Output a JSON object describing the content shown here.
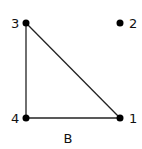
{
  "diagram": {
    "type": "graph",
    "caption": "B",
    "nodes": [
      {
        "id": "1",
        "label": "1",
        "x": 120,
        "y": 118,
        "label_dx": 9,
        "label_dy": 5
      },
      {
        "id": "2",
        "label": "2",
        "x": 120,
        "y": 23,
        "label_dx": 9,
        "label_dy": 5
      },
      {
        "id": "3",
        "label": "3",
        "x": 26,
        "y": 23,
        "label_dx": -15,
        "label_dy": 5
      },
      {
        "id": "4",
        "label": "4",
        "x": 26,
        "y": 118,
        "label_dx": -15,
        "label_dy": 5
      }
    ],
    "edges": [
      {
        "from": "3",
        "to": "4"
      },
      {
        "from": "4",
        "to": "1"
      },
      {
        "from": "3",
        "to": "1"
      }
    ],
    "colors": {
      "stroke": "#222222",
      "node": "#000000"
    }
  }
}
